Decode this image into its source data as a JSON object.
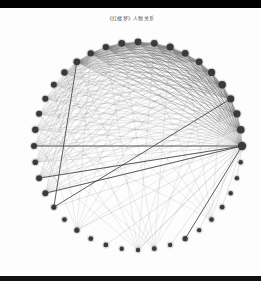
{
  "figure": {
    "title": "《红楼梦》人物关系",
    "background": "#fdfdfd",
    "node_color": "#3a3a3a",
    "edge_color": "#444444"
  },
  "graph": {
    "layout": "circular",
    "center": [
      138,
      146
    ],
    "radius": 104,
    "node_count": 40,
    "hub_indices": [
      0,
      1,
      2,
      3,
      4,
      5,
      6,
      7,
      8,
      9,
      10,
      11,
      12,
      13,
      14
    ],
    "primary_hub": 0,
    "secondary_hubs": [
      30,
      31,
      26,
      35
    ],
    "start_angle_deg": 0,
    "strong_edges": [
      [
        0,
        23
      ],
      [
        0,
        22
      ],
      [
        3,
        24
      ],
      [
        14,
        24
      ],
      [
        20,
        0
      ],
      [
        33,
        0
      ]
    ],
    "node_sizes": [
      4.2,
      3.8,
      3.6,
      3.6,
      3.8,
      3.6,
      3.4,
      3.4,
      3.6,
      3.4,
      3.4,
      3.4,
      3.2,
      3.2,
      3.4,
      3.2,
      3.0,
      3.0,
      3.0,
      3.2,
      3.0,
      2.8,
      3.0,
      3.0,
      2.6,
      2.4,
      2.6,
      2.4,
      2.4,
      2.2,
      2.2,
      2.4,
      2.2,
      2.6,
      2.2,
      2.4,
      2.4,
      2.2,
      2.2,
      2.2
    ]
  }
}
